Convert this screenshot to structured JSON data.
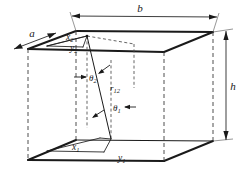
{
  "figure": {
    "type": "3d-rectangular-enclosure-geometry-diagram",
    "background_color": "#ffffff",
    "line_color": "#1a1a1a",
    "dimension_labels": {
      "depth": "a",
      "width": "b",
      "height": "h"
    },
    "point_labels": {
      "top_x": "x",
      "top_x_sub": "2",
      "top_y": "y",
      "top_y_sub": "2",
      "bottom_x": "x",
      "bottom_x_sub": "1",
      "bottom_y": "y",
      "bottom_y_sub": "1"
    },
    "angle_labels": {
      "upper": "θ",
      "upper_sub": "2",
      "lower": "θ",
      "lower_sub": "1"
    },
    "distance_label": {
      "symbol": "r",
      "sub": "12"
    }
  },
  "geometry": {
    "top_face": [
      [
        28,
        49
      ],
      [
        76,
        31
      ],
      [
        213,
        32
      ],
      [
        164,
        52
      ]
    ],
    "bottom_face": [
      [
        28,
        160
      ],
      [
        76,
        140
      ],
      [
        213,
        141
      ],
      [
        164,
        161
      ]
    ],
    "ray_endpoints": [
      [
        87,
        36
      ],
      [
        111,
        139
      ]
    ],
    "top_face_surface_lines": {
      "x_segment": [
        [
          76,
          45
        ],
        [
          87,
          36
        ]
      ],
      "y_segment": [
        [
          76,
          45
        ],
        [
          87,
          36
        ]
      ]
    }
  }
}
